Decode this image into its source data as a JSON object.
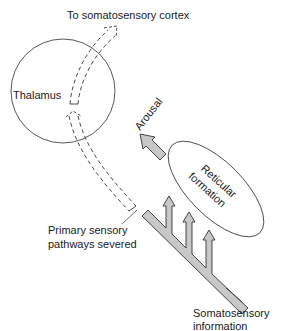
{
  "diagram": {
    "labels": {
      "cortex": "To somatosensory cortex",
      "thalamus": "Thalamus",
      "arousal": "Arousal",
      "reticular_line1": "Reticular",
      "reticular_line2": "formation",
      "severed_line1": "Primary sensory",
      "severed_line2": "pathways severed",
      "somato_line1": "Somatosensory",
      "somato_line2": "information"
    },
    "colors": {
      "stroke": "#333333",
      "pathway_fill": "#c8c8c8",
      "background": "#ffffff"
    }
  }
}
